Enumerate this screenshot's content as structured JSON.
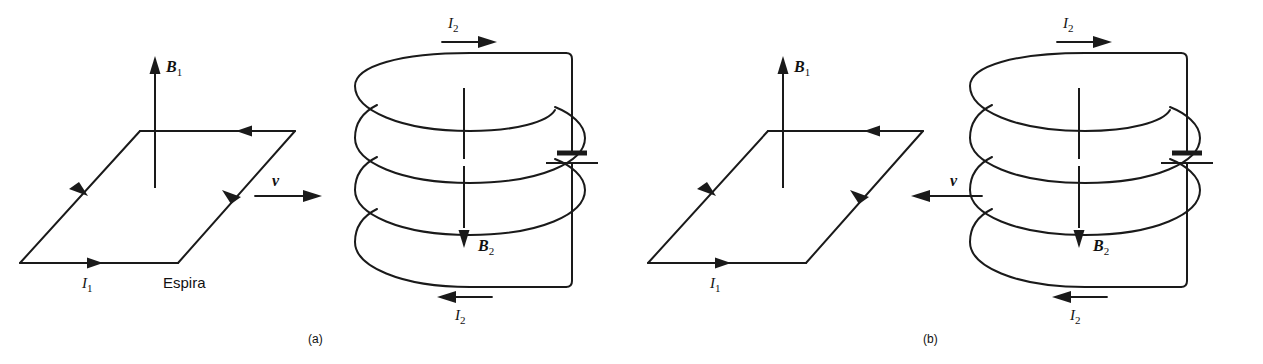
{
  "figure": {
    "background": "#ffffff",
    "ink": "#1a1a1a",
    "panels": [
      {
        "id": "panel-a",
        "caption": "(a)",
        "loop": {
          "name": "Espira",
          "loop_label": "Espira",
          "current_label": "I",
          "current_sub": "1",
          "field_label": "B",
          "field_sub": "1",
          "field_direction": "up",
          "velocity_label": "v",
          "velocity_direction": "right",
          "circulation": "counterclockwise-viewed-from-above"
        },
        "coil": {
          "turns": 3,
          "top_current_label": "I",
          "top_current_sub": "2",
          "top_current_direction": "right",
          "bottom_current_label": "I",
          "bottom_current_sub": "2",
          "bottom_current_direction": "left",
          "field_label": "B",
          "field_sub": "2",
          "field_direction": "down",
          "source": "battery"
        }
      },
      {
        "id": "panel-b",
        "caption": "(b)",
        "loop": {
          "name": "Espira",
          "loop_label": "",
          "current_label": "I",
          "current_sub": "1",
          "field_label": "B",
          "field_sub": "1",
          "field_direction": "up",
          "velocity_label": "v",
          "velocity_direction": "left",
          "circulation": "counterclockwise-viewed-from-above"
        },
        "coil": {
          "turns": 3,
          "top_current_label": "I",
          "top_current_sub": "2",
          "top_current_direction": "right",
          "bottom_current_label": "I",
          "bottom_current_sub": "2",
          "bottom_current_direction": "left",
          "field_label": "B",
          "field_sub": "2",
          "field_direction": "down",
          "source": "battery"
        }
      }
    ]
  }
}
